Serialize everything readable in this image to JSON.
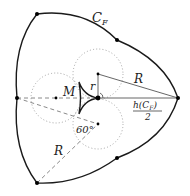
{
  "diagram": {
    "type": "geometric-construction",
    "colors": {
      "curve": "#1a1a1a",
      "dashed": "#888888",
      "dotted": "#999999",
      "points": "#000000"
    },
    "labels": {
      "curve_name": "C",
      "curve_sub": "F",
      "M": "M",
      "r": "r",
      "R_upper": "R",
      "R_lower": "R",
      "angle": "60°",
      "half_width_num_pre": "h(C",
      "half_width_num_sub": "F",
      "half_width_num_post": ")",
      "half_width_den": "2"
    },
    "points": [
      {
        "name": "vertex-top-left",
        "x": 37,
        "y": 14
      },
      {
        "name": "vertex-upper-right",
        "x": 117,
        "y": 40
      },
      {
        "name": "vertex-right",
        "x": 178,
        "y": 98
      },
      {
        "name": "vertex-lower-right",
        "x": 117,
        "y": 158
      },
      {
        "name": "vertex-bottom-left",
        "x": 37,
        "y": 183
      },
      {
        "name": "vertex-left",
        "x": 17,
        "y": 98
      },
      {
        "name": "center",
        "x": 98,
        "y": 98
      },
      {
        "name": "circle-center-top",
        "x": 98,
        "y": 74
      },
      {
        "name": "circle-center-bottom",
        "x": 98,
        "y": 124
      },
      {
        "name": "circle-center-left",
        "x": 56,
        "y": 98
      }
    ]
  }
}
